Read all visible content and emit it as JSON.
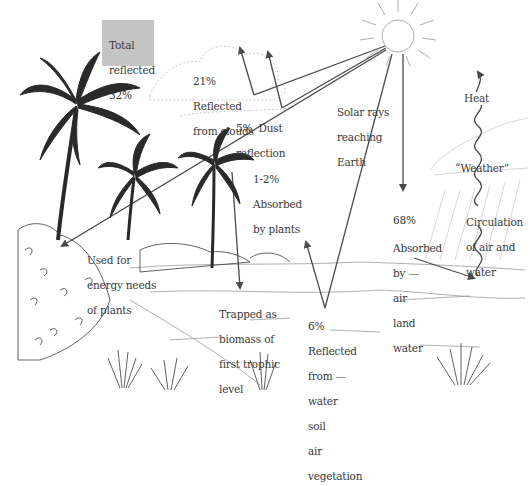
{
  "diagram": {
    "colors": {
      "background": "#ffffff",
      "ink": "#3a3a3a",
      "arrow": "#4a4a4a",
      "total_box": "#c4c4c4"
    },
    "labels": {
      "total_reflected": [
        "Total",
        "reflected",
        "32%"
      ],
      "clouds": [
        "21%",
        "Reflected",
        "from clouds"
      ],
      "dust": [
        "5%  Dust",
        "reflection"
      ],
      "solar_rays": [
        "Solar rays",
        "reaching",
        "Earth"
      ],
      "absorbed_plants": [
        "1-2%",
        "Absorbed",
        "by plants"
      ],
      "energy_needs": [
        "Used for",
        "energy needs",
        "of plants"
      ],
      "trapped": [
        "Trapped as",
        "biomass of",
        "first trophic",
        "level"
      ],
      "reflected_surface": [
        "6%",
        "Reflected",
        "from —",
        "water",
        "soil",
        "air",
        "vegetation"
      ],
      "absorbed_68": [
        "68%",
        "Absorbed",
        "by —",
        "air",
        "land",
        "water"
      ],
      "heat": "Heat",
      "weather": "“Weather”",
      "circulation": [
        "Circulation",
        "of air and",
        "water"
      ]
    },
    "icons": [
      "sun-icon",
      "cloud-icon",
      "palm-tree-icon",
      "shrub-icon",
      "grass-tuft-icon",
      "rain-cloud-icon",
      "wavy-heat-arrow-icon"
    ]
  }
}
